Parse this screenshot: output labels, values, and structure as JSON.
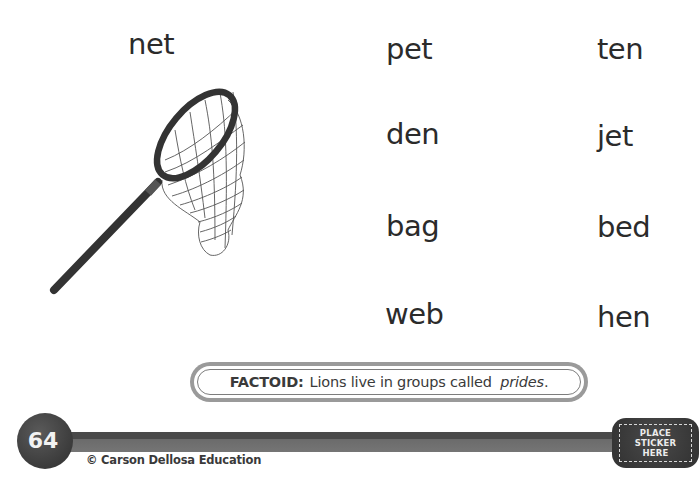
{
  "picture_word": "net",
  "word_columns": {
    "middle": [
      "pet",
      "den",
      "bag",
      "web"
    ],
    "right": [
      "ten",
      "jet",
      "bed",
      "hen"
    ]
  },
  "illustration": {
    "name": "butterfly-net-icon",
    "description": "net"
  },
  "factoid": {
    "label": "FACTOID:",
    "text": "Lions live in groups called ",
    "emphasis": "prides",
    "end": "."
  },
  "footer": {
    "page_number": "64",
    "copyright": "© Carson Dellosa Education",
    "sticker_lines": [
      "PLACE",
      "STICKER",
      "HERE"
    ]
  },
  "colors": {
    "text": "#2b2b2b",
    "footer_dark": "#3b3b3b",
    "factoid_border": "#9a9a9a"
  }
}
